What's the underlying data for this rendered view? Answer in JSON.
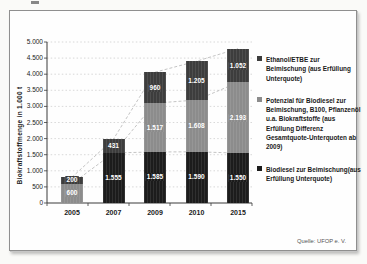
{
  "chart_data": {
    "type": "bar",
    "stacked": true,
    "title": "",
    "xlabel": "",
    "ylabel": "Biokraftstoffmenge in 1.000 t",
    "ylim": [
      0,
      5000
    ],
    "ytick_step": 500,
    "ytick_labels": [
      "0",
      "500",
      "1.000",
      "1.500",
      "2.000",
      "2.500",
      "3.000",
      "3.500",
      "4.000",
      "4.500",
      "5.000"
    ],
    "grid": "horizontal-dotted",
    "legend_position": "right",
    "categories": [
      "2005",
      "2007",
      "2009",
      "2010",
      "2015"
    ],
    "series": [
      {
        "name": "Biodiesel zur Beimischung(aus Erfüllung Unterquote)",
        "color": "#1c1c1c",
        "values": [
          0,
          1555,
          1585,
          1590,
          1550
        ],
        "labels": [
          "",
          "1.555",
          "1.585",
          "1.590",
          "1.550"
        ]
      },
      {
        "name": "Potenzial für Biodiesel zur Beimischung, B100, Pflanzenöl u.a. Biokraftstoffe (aus Erfüllung Differenz Gesamtquote-Unterquoten ab 2009)",
        "color": "#8c8c8c",
        "values": [
          600,
          0,
          1517,
          1608,
          2193
        ],
        "labels": [
          "600",
          "",
          "1.517",
          "1.608",
          "2.193"
        ]
      },
      {
        "name": "Ethanol/ETBE zur Beimischung (aus Erfüllung Unterquote)",
        "color": "#3d3d3d",
        "values": [
          200,
          431,
          960,
          1205,
          1052
        ],
        "labels": [
          "200",
          "431",
          "960",
          "1.205",
          "1.052"
        ]
      }
    ],
    "legend_order": [
      2,
      1,
      0
    ],
    "series_connector_lines": true,
    "totals": [
      800,
      1986,
      4062,
      4403,
      4795
    ]
  },
  "source": {
    "text": "Quelle: UFOP e. V."
  }
}
